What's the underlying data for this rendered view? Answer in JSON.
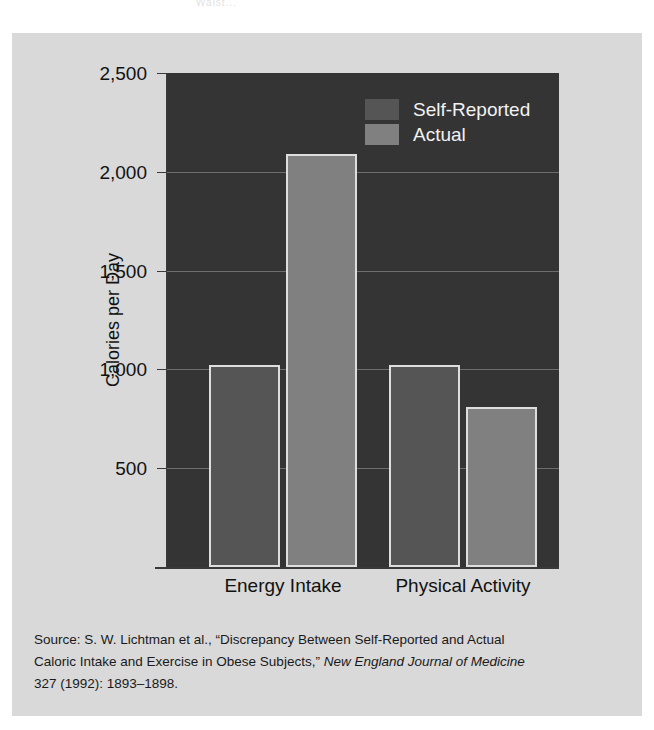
{
  "page": {
    "background": "#ffffff",
    "figure_background": "#d9d9d9",
    "top_cropped_text": "Waist..."
  },
  "chart_data": {
    "type": "bar",
    "title": "",
    "subtitle": "",
    "xlabel": "",
    "ylabel": "Calories per Day",
    "categories": [
      "Energy Intake",
      "Physical Activity"
    ],
    "series": [
      {
        "name": "Self-Reported",
        "color": "#555555",
        "values": [
          1020,
          1020
        ]
      },
      {
        "name": "Actual",
        "color": "#808080",
        "values": [
          2090,
          810
        ]
      }
    ],
    "ylim": [
      0,
      2500
    ],
    "yticks": [
      2500,
      2000,
      1500,
      1000,
      500
    ],
    "ytick_labels": [
      "2,500",
      "2,000",
      "1,500",
      "1,000",
      "500"
    ],
    "grid": true,
    "grid_color": "#6d6d6d",
    "legend_position": "upper right inside plot",
    "plot_background": "#343434",
    "bar_edge_color": "#dedede",
    "axis_color": "#3a3a3a",
    "annotations": []
  },
  "legend": {
    "items": [
      {
        "label": "Self-Reported",
        "swatch": "self"
      },
      {
        "label": "Actual",
        "swatch": "actual"
      }
    ]
  },
  "axis": {
    "y_title": "Calories per Day",
    "ticks": [
      {
        "label": "2,500"
      },
      {
        "label": "2,000"
      },
      {
        "label": "1,500"
      },
      {
        "label": "1,000"
      },
      {
        "label": "500"
      }
    ],
    "categories": [
      {
        "label": "Energy Intake"
      },
      {
        "label": "Physical Activity"
      }
    ]
  },
  "source": {
    "line1": "Source: S. W. Lichtman et al., “Discrepancy Between Self-Reported and Actual",
    "line2_pre": "Caloric Intake and Exercise in Obese Subjects,” ",
    "line2_italic": "New England Journal of Medicine",
    "line3": "327 (1992): 1893–1898."
  }
}
